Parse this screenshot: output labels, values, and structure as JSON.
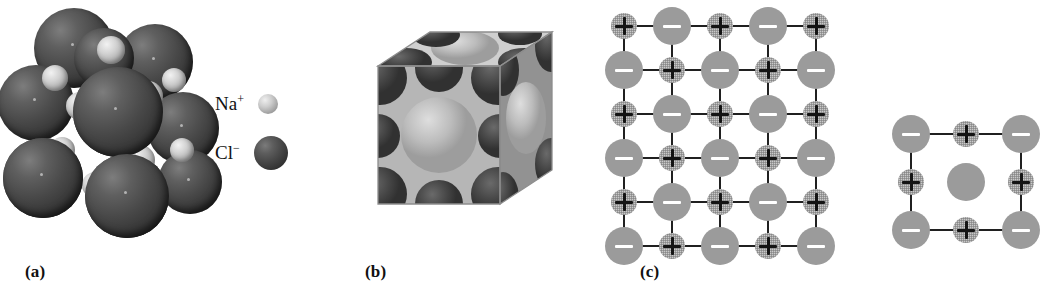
{
  "figure": {
    "background_color": "#ffffff",
    "panels": [
      {
        "id": "a",
        "caption": "(a)",
        "description": "space-filling sphere packing model"
      },
      {
        "id": "b",
        "caption": "(b)",
        "description": "cut-away cubic unit cell"
      },
      {
        "id": "c",
        "caption": "(c)",
        "description": "two-dimensional ionic lattice schematic"
      }
    ]
  },
  "panel_a": {
    "caption": "(a)",
    "legend": [
      {
        "label_base": "Na",
        "label_charge": "+",
        "species": "sodium-ion",
        "swatch": "small-light-sphere",
        "color": "#b4b4b4"
      },
      {
        "label_base": "Cl",
        "label_charge": "−",
        "species": "chloride-ion",
        "swatch": "large-dark-sphere",
        "color": "#454545"
      }
    ],
    "cluster": {
      "note": "large dark chloride spheres with smaller light sodium spheres between them",
      "chloride_color": "#454545",
      "sodium_color": "#c6c6c6",
      "chloride_spheres": [
        {
          "cx": 74,
          "cy": 48,
          "r": 40
        },
        {
          "cx": 155,
          "cy": 62,
          "r": 38
        },
        {
          "cx": 36,
          "cy": 103,
          "r": 38
        },
        {
          "cx": 118,
          "cy": 112,
          "r": 45
        },
        {
          "cx": 183,
          "cy": 128,
          "r": 36
        },
        {
          "cx": 43,
          "cy": 178,
          "r": 40
        },
        {
          "cx": 127,
          "cy": 196,
          "r": 42
        },
        {
          "cx": 190,
          "cy": 182,
          "r": 32
        },
        {
          "cx": 104,
          "cy": 58,
          "r": 30
        }
      ],
      "sodium_spheres": [
        {
          "cx": 111,
          "cy": 50,
          "r": 14
        },
        {
          "cx": 55,
          "cy": 78,
          "r": 13
        },
        {
          "cx": 148,
          "cy": 96,
          "r": 15
        },
        {
          "cx": 80,
          "cy": 106,
          "r": 14
        },
        {
          "cx": 174,
          "cy": 80,
          "r": 12
        },
        {
          "cx": 62,
          "cy": 150,
          "r": 13
        },
        {
          "cx": 140,
          "cy": 160,
          "r": 15
        },
        {
          "cx": 95,
          "cy": 185,
          "r": 13
        },
        {
          "cx": 182,
          "cy": 150,
          "r": 12
        }
      ]
    }
  },
  "panel_b": {
    "caption": "(b)",
    "cell": {
      "note": "cubic unit cell sliced open showing circular cross-sections of ions",
      "top_face_color": "#c8c8c8",
      "front_face_color": "#b0b0b0",
      "right_face_color": "#8e8e8e",
      "light_sphere_color": "#bdbdbd",
      "dark_sphere_color": "#4a4a4a"
    }
  },
  "panel_c": {
    "caption": "(c)",
    "ion_styles": {
      "negative": {
        "symbol": "−",
        "fill": "#9b9b9b",
        "sign_color": "#ffffff",
        "radius": 19,
        "species": "chloride-ion"
      },
      "positive": {
        "symbol": "+",
        "fill": "#c9c9c9",
        "sign_color": "#141414",
        "radius": 13,
        "species": "sodium-ion"
      }
    },
    "bond_color": "#202020",
    "main_lattice": {
      "columns": 5,
      "rows": 6,
      "pattern": [
        [
          "+",
          "-",
          "+",
          "-",
          "+"
        ],
        [
          "-",
          "+",
          "-",
          "+",
          "-"
        ],
        [
          "+",
          "-",
          "+",
          "-",
          "+"
        ],
        [
          "-",
          "+",
          "-",
          "+",
          "-"
        ],
        [
          "+",
          "-",
          "+",
          "-",
          "+"
        ],
        [
          "-",
          "+",
          "-",
          "+",
          "-"
        ]
      ]
    },
    "fragment_lattice": {
      "columns": 3,
      "rows": 3,
      "note": "center site drawn as an unmarked sphere",
      "pattern": [
        [
          "-",
          "+",
          "-"
        ],
        [
          "+",
          "0",
          "+"
        ],
        [
          "-",
          "+",
          "-"
        ]
      ]
    }
  }
}
